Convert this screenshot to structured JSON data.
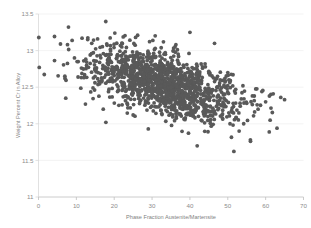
{
  "chart_data": {
    "type": "scatter",
    "title": "",
    "xlabel": "Phase Fraction Austenite/Martensite",
    "ylabel": "Weight Percent Cr in Alloy",
    "xlim": [
      0,
      70
    ],
    "ylim": [
      11,
      13.5
    ],
    "xticks": [
      0,
      10,
      20,
      30,
      40,
      50,
      60,
      70
    ],
    "yticks": [
      11,
      11.5,
      12,
      12.5,
      13,
      13.5
    ],
    "xtick_labels": [
      "0",
      "10",
      "20",
      "30",
      "40",
      "50",
      "60",
      "70"
    ],
    "ytick_labels": [
      "11",
      "11.5",
      "12",
      "12.5",
      "13",
      "13.5"
    ],
    "grid": true,
    "grid_axis": "y",
    "legend": false,
    "marker_color": "#595959",
    "marker_size": 1.9,
    "n_points": 1400,
    "correlation": -0.55,
    "x_center": 33.0,
    "y_center": 12.55,
    "x_spread": 9.5,
    "y_spread": 0.24,
    "series": [
      {
        "name": "Alloy samples",
        "color": "#595959",
        "points": [
          [
            0.2,
            12.77
          ],
          [
            5.8,
            13.09
          ],
          [
            7.0,
            12.62
          ],
          [
            7.2,
            12.35
          ],
          [
            9.5,
            12.9
          ],
          [
            10.2,
            12.85
          ],
          [
            11.5,
            13.17
          ],
          [
            12.0,
            12.63
          ],
          [
            12.4,
            12.27
          ],
          [
            13.0,
            13.15
          ],
          [
            14.0,
            12.96
          ],
          [
            15.2,
            12.74
          ],
          [
            16.0,
            12.58
          ],
          [
            17.1,
            12.2
          ],
          [
            17.8,
            12.02
          ],
          [
            18.5,
            12.88
          ],
          [
            19.0,
            13.02
          ],
          [
            20.0,
            12.66
          ],
          [
            21.0,
            12.45
          ],
          [
            22.0,
            13.05
          ],
          [
            23.0,
            12.79
          ],
          [
            24.5,
            12.54
          ],
          [
            25.0,
            12.12
          ],
          [
            26.0,
            12.98
          ],
          [
            27.0,
            12.71
          ],
          [
            28.0,
            12.48
          ],
          [
            29.0,
            11.93
          ],
          [
            30.0,
            12.86
          ],
          [
            31.0,
            12.6
          ],
          [
            32.0,
            12.33
          ],
          [
            33.0,
            13.12
          ],
          [
            34.0,
            12.75
          ],
          [
            35.0,
            12.5
          ],
          [
            36.0,
            12.22
          ],
          [
            37.0,
            12.92
          ],
          [
            38.0,
            12.64
          ],
          [
            39.0,
            12.38
          ],
          [
            40.0,
            13.25
          ],
          [
            41.0,
            12.56
          ],
          [
            42.0,
            12.3
          ],
          [
            43.0,
            12.05
          ],
          [
            44.0,
            12.82
          ],
          [
            45.0,
            12.45
          ],
          [
            46.5,
            13.1
          ],
          [
            47.0,
            12.24
          ],
          [
            48.0,
            12.6
          ],
          [
            49.0,
            12.35
          ],
          [
            50.0,
            12.7
          ],
          [
            51.0,
            12.18
          ],
          [
            52.0,
            12.42
          ],
          [
            53.0,
            11.9
          ],
          [
            54.0,
            12.52
          ],
          [
            55.0,
            12.28
          ],
          [
            56.0,
            11.76
          ],
          [
            57.0,
            12.38
          ],
          [
            58.0,
            12.2
          ],
          [
            59.0,
            12.44
          ],
          [
            60.0,
            12.3
          ],
          [
            61.0,
            12.38
          ],
          [
            62.0,
            12.41
          ],
          [
            63.0,
            11.94
          ],
          [
            64.0,
            12.36
          ],
          [
            65.0,
            12.33
          ]
        ]
      }
    ]
  },
  "axes": {
    "x_axis_name": "Phase Fraction Austenite/Martensite",
    "y_axis_name": "Weight Percent Cr in Alloy"
  }
}
